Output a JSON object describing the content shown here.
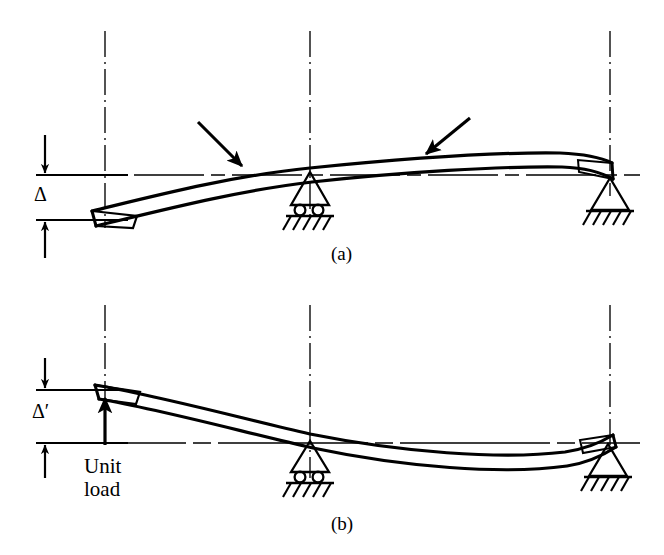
{
  "figure": {
    "background_color": "#ffffff",
    "line_color": "#000000",
    "width": 664,
    "height": 555
  },
  "labels": {
    "panel_a": "(a)",
    "panel_b": "(b)",
    "delta": "Δ",
    "delta_prime": "Δ′",
    "unit_load_line1": "Unit",
    "unit_load_line2": "load"
  },
  "diagram_a": {
    "name": "deflected-beam-under-two-loads",
    "supports": [
      {
        "type": "roller",
        "x": 310,
        "y": 180
      },
      {
        "type": "pin",
        "x": 610,
        "y": 182
      }
    ],
    "loads": [
      {
        "type": "point-load-arrow",
        "tip_x": 243,
        "tip_y": 167,
        "tail_x": 198,
        "tail_y": 122
      },
      {
        "type": "point-load-arrow",
        "tip_x": 425,
        "tip_y": 155,
        "tail_x": 470,
        "tail_y": 118
      }
    ],
    "free_end": {
      "x": 92,
      "y": 218
    },
    "deflection_label": "Δ",
    "deflection_top_y": 175,
    "deflection_bottom_y": 220
  },
  "diagram_b": {
    "name": "deflected-beam-under-unit-load",
    "supports": [
      {
        "type": "roller",
        "x": 310,
        "y": 447
      },
      {
        "type": "pin",
        "x": 610,
        "y": 440
      }
    ],
    "loads": [
      {
        "type": "unit-load-arrow",
        "tip_x": 105,
        "tip_y": 398,
        "tail_x": 105,
        "tail_y": 443
      }
    ],
    "free_end": {
      "x": 95,
      "y": 390
    },
    "deflection_label": "Δ′",
    "deflection_top_y": 390,
    "deflection_bottom_y": 443
  },
  "guides": {
    "vertical_centerlines_x": [
      105,
      310,
      610
    ],
    "reference_line_a_y": 175,
    "reference_line_b_y": 443
  }
}
